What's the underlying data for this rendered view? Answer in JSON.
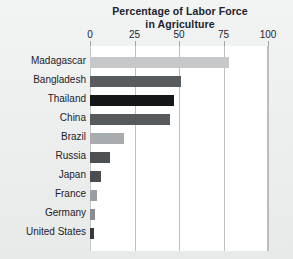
{
  "chart": {
    "title_line1": "Percentage of Labor Force",
    "title_line2": "in Agriculture"
  },
  "chart_data": {
    "type": "bar",
    "orientation": "horizontal",
    "title": "Percentage of Labor Force in Agriculture",
    "xlabel": "",
    "ylabel": "",
    "xlim": [
      0,
      100
    ],
    "xticks": [
      "0",
      "25",
      "50",
      "75",
      "100"
    ],
    "xtick_values": [
      0,
      25,
      50,
      75,
      100
    ],
    "grid": "vertical",
    "legend": "none",
    "categories": [
      "Madagascar",
      "Bangladesh",
      "Thailand",
      "China",
      "Brazil",
      "Russia",
      "Japan",
      "France",
      "Germany",
      "United States"
    ],
    "values": [
      78,
      51,
      47,
      45,
      19,
      11,
      6,
      4,
      3,
      2
    ],
    "bar_colors": [
      "#c6c8c9",
      "#585c5f",
      "#141618",
      "#565a5d",
      "#a9acae",
      "#4c5053",
      "#4a4e51",
      "#9b9ea0",
      "#8a8d90",
      "#35393c"
    ]
  },
  "colors": {
    "background": "#eef0f0",
    "plot_background": "#ffffff",
    "gridline": "#bcbfc1",
    "text": "#20242b"
  }
}
